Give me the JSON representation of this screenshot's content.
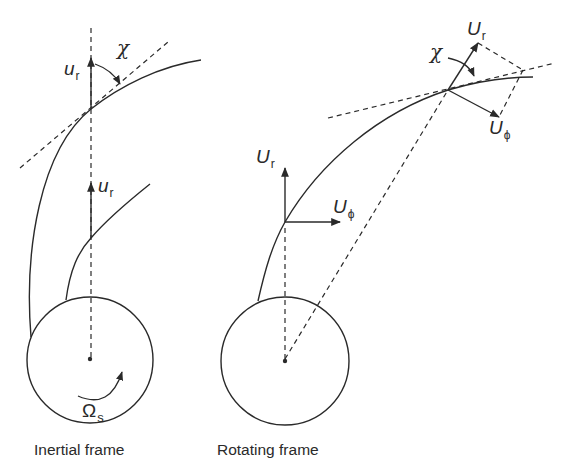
{
  "figure": {
    "inertial": {
      "caption": "Inertial frame",
      "velocity_label_top": {
        "symbol": "u",
        "subscript": "r"
      },
      "velocity_label_inner": {
        "symbol": "u",
        "subscript": "r"
      },
      "angle_label": "χ",
      "rotation_label": {
        "symbol": "Ω",
        "subscript": "s"
      }
    },
    "rotating": {
      "caption": "Rotating frame",
      "radial_label_low": {
        "symbol": "U",
        "subscript": "r"
      },
      "azimuthal_label_low": {
        "symbol": "U",
        "subscript": "ϕ"
      },
      "radial_label_high": {
        "symbol": "U",
        "subscript": "r"
      },
      "azimuthal_label_high": {
        "symbol": "U",
        "subscript": "ϕ"
      },
      "angle_label": "χ"
    },
    "colors": {
      "line": "#2a2a2a",
      "background": "#ffffff"
    }
  }
}
